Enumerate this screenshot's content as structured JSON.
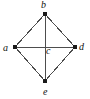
{
  "figure": {
    "type": "undirected-graph-diagram",
    "width": 90,
    "height": 99,
    "background_color": "#ffffff",
    "edge_color": "#4d4d4d",
    "node_color": "#1a1a1a",
    "label_color": "#111111"
  },
  "nodes": [
    {
      "id": "a",
      "label": "a",
      "x": 15,
      "y": 47,
      "marker": "filled-square",
      "marker_size": 4,
      "label_x": 3,
      "label_y": 43
    },
    {
      "id": "b",
      "label": "b",
      "x": 45,
      "y": 14,
      "marker": "filled-square",
      "marker_size": 4,
      "label_x": 41,
      "label_y": 0
    },
    {
      "id": "c",
      "label": "c",
      "x": 45,
      "y": 47,
      "marker": "none",
      "marker_size": 0,
      "label_x": 46,
      "label_y": 46
    },
    {
      "id": "d",
      "label": "d",
      "x": 75,
      "y": 47,
      "marker": "filled-square",
      "marker_size": 4,
      "label_x": 79,
      "label_y": 42
    },
    {
      "id": "e",
      "label": "e",
      "x": 45,
      "y": 81,
      "marker": "filled-square",
      "marker_size": 4,
      "label_x": 43,
      "label_y": 87
    }
  ],
  "edges": [
    {
      "from": "a",
      "to": "b"
    },
    {
      "from": "b",
      "to": "d"
    },
    {
      "from": "a",
      "to": "e"
    },
    {
      "from": "d",
      "to": "e"
    },
    {
      "from": "a",
      "to": "d"
    },
    {
      "from": "b",
      "to": "e"
    }
  ]
}
